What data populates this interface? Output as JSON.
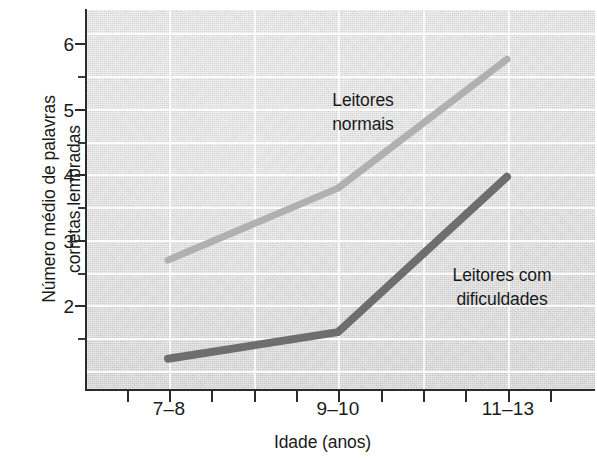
{
  "chart_data": {
    "type": "line",
    "title": "",
    "xlabel": "Idade (anos)",
    "ylabel": "Número médio de palavras\ncorretas lembradas",
    "categories": [
      "7–8",
      "9–10",
      "11–13"
    ],
    "ylim": [
      1.5,
      6.5
    ],
    "ytick_labels": [
      "6",
      "5",
      "4",
      "3",
      "2"
    ],
    "ytick_values": [
      6,
      5,
      4,
      3,
      2
    ],
    "yminor_values": [
      6.5,
      5.5,
      4.5,
      3.5,
      2.5,
      1.75
    ],
    "grid": true,
    "grid_axis": "both",
    "legend_position": "inline-annotations",
    "series": [
      {
        "name": "Leitores normais",
        "label": "Leitores\nnormais",
        "color": "#b0b0b0",
        "values": [
          3.2,
          4.15,
          5.85
        ]
      },
      {
        "name": "Leitores com dificuldades",
        "label": "Leitores com\ndificuldades",
        "color": "#6e6e6e",
        "values": [
          1.9,
          2.25,
          4.3
        ]
      }
    ],
    "colors": {
      "plot_background": "#d3d3d3",
      "gridline": "#ffffff",
      "axis": "#2b2b2b",
      "text": "#1a1a1a"
    }
  }
}
